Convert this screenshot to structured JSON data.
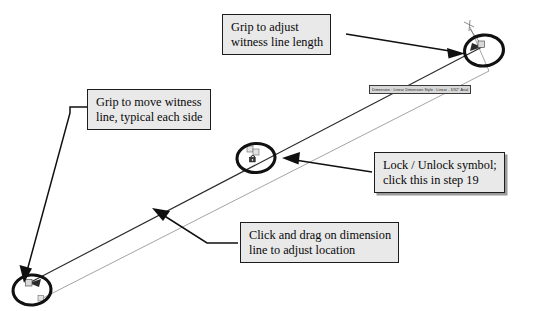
{
  "document": {
    "title": "Dimension grip editing diagram",
    "background_color": "#ffffff"
  },
  "colors": {
    "callout_fill": "#e9e9e9",
    "callout_border": "#1d1d1d",
    "marker_stroke": "#111111",
    "dimension_line": "#2b2b2b",
    "witness_line": "#8d8d8d",
    "tooltip_fill": "#d8d8d8",
    "text": "#080808"
  },
  "callouts": [
    {
      "id": "grip-adjust-witness-length",
      "line1": "Grip to adjust",
      "line2": "witness line length",
      "points_to": "top-right-grip"
    },
    {
      "id": "grip-move-witness-line",
      "line1": "Grip to move witness",
      "line2": "line, typical each side",
      "points_to": "bottom-left-grip"
    },
    {
      "id": "lock-unlock-symbol",
      "line1": "Lock / Unlock symbol;",
      "line2": "click this in step 19",
      "points_to": "center-lock-grip"
    },
    {
      "id": "click-drag-dimension-line",
      "line1": "Click and drag on dimension",
      "line2": "line to adjust location",
      "points_to": "dimension-line"
    }
  ],
  "tooltip": {
    "text": "Dimension : Linear   Dimension Style : Linear - 3/32\" Arial"
  },
  "markers": {
    "top_right_grip_label": "witness line length grip",
    "bottom_left_grip_label": "witness line move grip",
    "center_lock_label": "lock / unlock grip"
  }
}
